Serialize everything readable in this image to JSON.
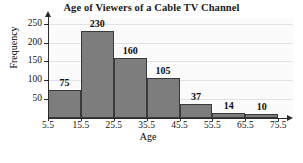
{
  "chart_data": {
    "type": "bar",
    "title": "Age of Viewers of a Cable TV Channel",
    "xlabel": "Age",
    "ylabel": "Frequency",
    "categories": [
      "5.5-15.5",
      "15.5-25.5",
      "25.5-35.5",
      "35.5-45.5",
      "45.5-55.5",
      "55.5-65.5",
      "65.5-75.5"
    ],
    "values": [
      75,
      230,
      160,
      105,
      37,
      14,
      10
    ],
    "bin_edges": [
      5.5,
      15.5,
      25.5,
      35.5,
      45.5,
      55.5,
      65.5,
      75.5
    ],
    "x_tick_labels": [
      "5.5",
      "15.5",
      "25.5",
      "35.5",
      "45.5",
      "55.5",
      "65.5",
      "75.5"
    ],
    "y_tick_labels": [
      "50",
      "100",
      "150",
      "200",
      "250"
    ],
    "y_tick_values": [
      50,
      100,
      150,
      200,
      250
    ],
    "ylim": [
      0,
      265
    ],
    "xlim": [
      5.5,
      75.5
    ],
    "grid": true,
    "legend": "none",
    "bar_color": "#7d7d7d",
    "bar_edge_color": "#3a3a3a",
    "plot_background": "#fbfbfb",
    "gridline_color": "#e2e2e2",
    "axis_color": "#2b2b2b",
    "data_labels": [
      "75",
      "230",
      "160",
      "105",
      "37",
      "14",
      "10"
    ]
  }
}
